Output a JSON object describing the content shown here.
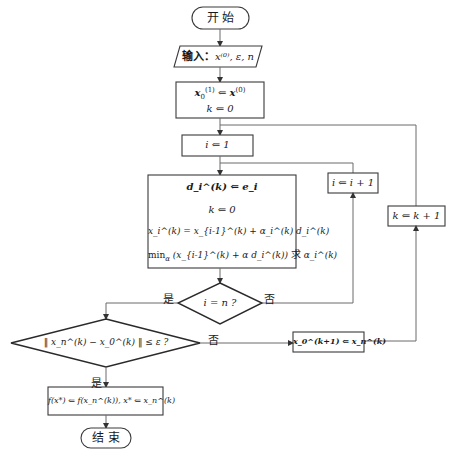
{
  "flowchart": {
    "start": {
      "label": "开 始"
    },
    "input": {
      "prefix": "输入：",
      "vars": "x⁽⁰⁾, ε, n"
    },
    "init": {
      "line1_lhs": "x",
      "line1_sub": "0",
      "line1_sup": "(1)",
      "line1_op": " ⇐ ",
      "line1_rhs": "x",
      "line1_rhs_sup": "(0)",
      "line2": "k ⇐ 0"
    },
    "set_i": {
      "text": "i ⇐ 1"
    },
    "inner_loop_body": {
      "line1": "d_i^(k) ⇐ e_i",
      "line2": "k ⇐ 0",
      "line3": "x_i^(k) = x_{i-1}^(k) + α_i^(k) d_i^(k)",
      "line4_min": "min",
      "line4_min_sub": "α",
      "line4_expr": "(x_{i-1}^(k) + α d_i^(k))",
      "line4_suffix": "求",
      "line4_target": "α_i^(k)"
    },
    "increment_i": {
      "text": "i ⇐ i + 1"
    },
    "increment_k": {
      "text": "k ⇐ k + 1"
    },
    "decision_i": {
      "text": "i = n ?",
      "yes": "是",
      "no": "否"
    },
    "decision_conv": {
      "text": "‖ x_n^(k) − x_0^(k) ‖ ≤ ε ?",
      "yes": "是",
      "no": "否"
    },
    "update_x0": {
      "text": "x_0^(k+1) ⇐ x_n^(k)"
    },
    "result": {
      "text": "f(x*) ⇐ f(x_n^(k)), x* ⇐ x_n^(k)"
    },
    "end": {
      "label": "结 束"
    }
  }
}
